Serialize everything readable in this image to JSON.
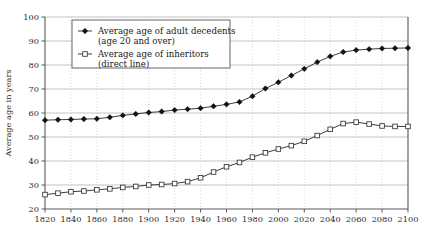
{
  "chart_data": {
    "type": "line",
    "title": "",
    "xlabel": "",
    "ylabel": "Average age in years",
    "xlim": [
      1820,
      2100
    ],
    "ylim": [
      20,
      100
    ],
    "grid": true,
    "legend_position": "top-left-inside",
    "x_ticks": [
      1820,
      1840,
      1860,
      1880,
      1900,
      1920,
      1940,
      1960,
      1980,
      2000,
      2020,
      2040,
      2060,
      2080,
      2100
    ],
    "y_ticks": [
      20,
      30,
      40,
      50,
      60,
      70,
      80,
      90,
      100
    ],
    "x": [
      1820,
      1830,
      1840,
      1850,
      1860,
      1870,
      1880,
      1890,
      1900,
      1910,
      1920,
      1930,
      1940,
      1950,
      1960,
      1970,
      1980,
      1990,
      2000,
      2010,
      2020,
      2030,
      2040,
      2050,
      2060,
      2070,
      2080,
      2090,
      2100
    ],
    "series": [
      {
        "name": "Average age of adult decedents (age 20 and over)",
        "marker": "filled-diamond",
        "values": [
          57.0,
          57.2,
          57.3,
          57.5,
          57.6,
          58.2,
          59.0,
          59.6,
          60.2,
          60.6,
          61.2,
          61.6,
          62.0,
          62.8,
          63.6,
          64.6,
          67.0,
          70.2,
          72.8,
          75.6,
          78.4,
          81.2,
          83.6,
          85.4,
          86.2,
          86.6,
          86.9,
          87.0,
          87.1
        ]
      },
      {
        "name": "Average age of inheritors (direct line)",
        "marker": "open-square",
        "values": [
          26.0,
          26.6,
          27.2,
          27.5,
          28.0,
          28.4,
          29.0,
          29.4,
          30.0,
          30.2,
          30.6,
          31.4,
          33.0,
          35.4,
          37.6,
          39.4,
          41.6,
          43.4,
          45.0,
          46.4,
          48.2,
          50.6,
          53.2,
          55.6,
          56.2,
          55.4,
          54.6,
          54.4,
          54.4
        ]
      }
    ],
    "legend": [
      {
        "marker": "filled-diamond",
        "line1": "Average age of adult decedents",
        "line2": "(age 20 and over)"
      },
      {
        "marker": "open-square",
        "line1": "Average age of inheritors",
        "line2": "(direct line)"
      }
    ]
  },
  "colors": {
    "series_line": "#1a1a1a",
    "grid_horizontal": "#b4b4b4",
    "grid_vertical": "#c8c8c8",
    "axis": "#5a5a5a",
    "background": "#ffffff"
  }
}
